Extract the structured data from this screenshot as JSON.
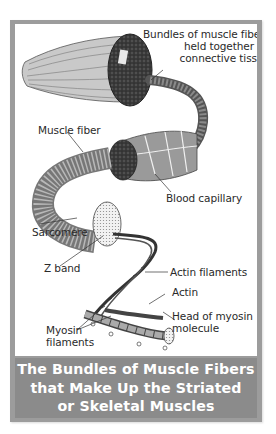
{
  "figure": {
    "caption_lines": [
      "The Bundles of Muscle Fibers",
      "that Make Up the Striated",
      "or Skeletal Muscles"
    ],
    "colors": {
      "frame": "#9c9c9c",
      "caption_background": "#8b8b8b",
      "caption_text": "#ffffff",
      "panel_background": "#ffffff",
      "label_text": "#2a2a2a"
    }
  },
  "labels": {
    "bundles": [
      "Bundles of muscle fibers",
      "held together by",
      "connective tissue"
    ],
    "muscle_fiber": "Muscle fiber",
    "blood_capillary": "Blood capillary",
    "sarcomere": "Sarcomere",
    "z_band": "Z band",
    "actin_filaments": "Actin filaments",
    "actin": "Actin",
    "head_of_myosin": [
      "Head of myosin",
      "molecule"
    ],
    "myosin_filaments": [
      "Myosin",
      "filaments"
    ]
  }
}
